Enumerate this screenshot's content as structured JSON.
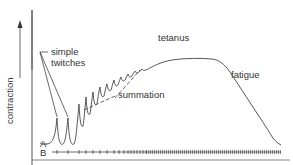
{
  "figure": {
    "y_axis_label": "contraction",
    "labels": {
      "simple_twitches_line1": "simple",
      "simple_twitches_line2": "twitches",
      "summation": "summation",
      "tetanus": "tetanus",
      "fatigue": "fatigue",
      "trace_a": "A",
      "trace_b": "B"
    },
    "colors": {
      "line": "#444444",
      "text": "#333333",
      "background": "#ffffff"
    }
  }
}
